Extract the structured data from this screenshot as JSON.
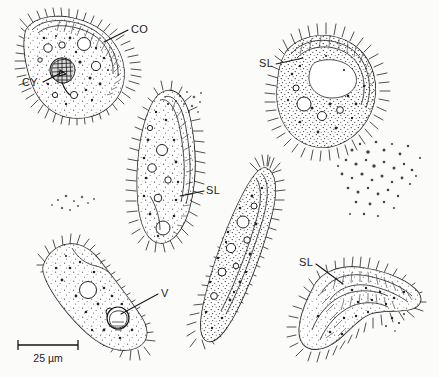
{
  "figure": {
    "kind": "scientific-line-drawing",
    "background_color": "#fbfbfa",
    "ink_color": "#141414",
    "width": 439,
    "height": 377
  },
  "labels": [
    {
      "id": "co",
      "text": "CO",
      "x": 131,
      "y": 33,
      "anchor": "start"
    },
    {
      "id": "cy",
      "text": "CY",
      "x": 22,
      "y": 86,
      "anchor": "start"
    },
    {
      "id": "sl1",
      "text": "SL",
      "x": 259,
      "y": 67,
      "anchor": "start"
    },
    {
      "id": "sl2",
      "text": "SL",
      "x": 206,
      "y": 194,
      "anchor": "start"
    },
    {
      "id": "sl3",
      "text": "SL",
      "x": 299,
      "y": 266,
      "anchor": "start"
    },
    {
      "id": "v",
      "text": "V",
      "x": 161,
      "y": 297,
      "anchor": "start"
    }
  ],
  "scale_bar": {
    "text": "25 µm",
    "x1": 18,
    "x2": 78,
    "y": 345,
    "label_x": 48,
    "label_y": 362
  },
  "specimens": [
    {
      "id": "specimen-upper-left",
      "shape": "crescent",
      "labels": [
        "CO",
        "CY"
      ]
    },
    {
      "id": "specimen-upper-right",
      "shape": "oval-diagonal",
      "labels": [
        "SL"
      ]
    },
    {
      "id": "specimen-center",
      "shape": "elongate-teardrop",
      "labels": [
        "SL"
      ]
    },
    {
      "id": "specimen-center-right",
      "shape": "long-spindle",
      "labels": [
        "SL"
      ]
    },
    {
      "id": "specimen-lower-left",
      "shape": "elongate-ovoid",
      "labels": [
        "V"
      ]
    },
    {
      "id": "specimen-lower-right",
      "shape": "folded-crescent",
      "labels": [
        "SL"
      ]
    }
  ],
  "debris_fields": [
    {
      "id": "debris-right",
      "cx": 378,
      "cy": 168
    },
    {
      "id": "debris-upper-mid",
      "cx": 190,
      "cy": 100
    },
    {
      "id": "debris-left",
      "cx": 72,
      "cy": 205
    }
  ]
}
